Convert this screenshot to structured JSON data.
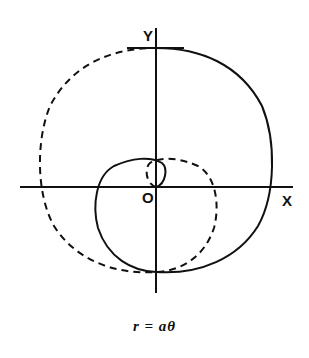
{
  "diagram": {
    "axes": {
      "x_label": "X",
      "y_label": "Y",
      "origin_label": "O"
    },
    "caption": "r  =  aθ",
    "curves": [
      {
        "name": "spiral-positive-theta",
        "style": "solid"
      },
      {
        "name": "spiral-negative-theta",
        "style": "dashed"
      }
    ],
    "colors": {
      "stroke": "#111111",
      "background": "#ffffff"
    }
  }
}
